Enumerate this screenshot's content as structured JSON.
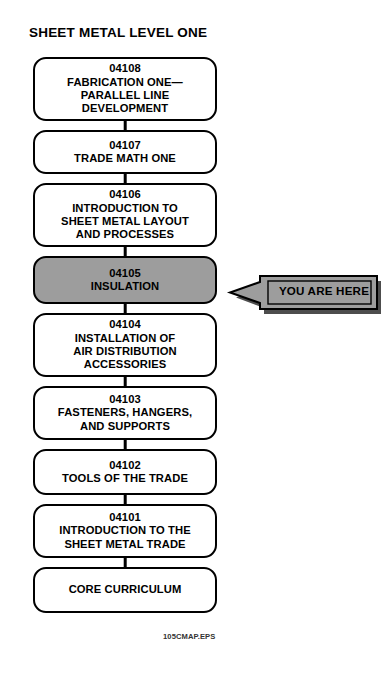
{
  "title": "SHEET METAL LEVEL ONE",
  "footer_code": "105CMAP.EPS",
  "colors": {
    "highlight_fill": "#9d9d9d",
    "callout_fill": "#9d9d9d",
    "callout_shadow": "#4d4d4d",
    "outline": "#000000",
    "node_fill": "#ffffff",
    "page_background": "#ffffff"
  },
  "callout": {
    "label": "YOU ARE HERE",
    "points_to": "04105"
  },
  "flow": {
    "orientation": "vertical-descending",
    "nodes": [
      {
        "code": "04108",
        "lines": [
          "FABRICATION ONE—",
          "PARALLEL LINE",
          "DEVELOPMENT"
        ],
        "highlighted": false,
        "height": 64
      },
      {
        "code": "04107",
        "lines": [
          "TRADE MATH ONE"
        ],
        "highlighted": false,
        "height": 44
      },
      {
        "code": "04106",
        "lines": [
          "INTRODUCTION TO",
          "SHEET METAL LAYOUT",
          "AND PROCESSES"
        ],
        "highlighted": false,
        "height": 64
      },
      {
        "code": "04105",
        "lines": [
          "INSULATION"
        ],
        "highlighted": true,
        "height": 48
      },
      {
        "code": "04104",
        "lines": [
          "INSTALLATION OF",
          "AIR DISTRIBUTION",
          "ACCESSORIES"
        ],
        "highlighted": false,
        "height": 64
      },
      {
        "code": "04103",
        "lines": [
          "FASTENERS, HANGERS,",
          "AND SUPPORTS"
        ],
        "highlighted": false,
        "height": 54
      },
      {
        "code": "04102",
        "lines": [
          "TOOLS OF THE TRADE"
        ],
        "highlighted": false,
        "height": 46
      },
      {
        "code": "04101",
        "lines": [
          "INTRODUCTION TO THE",
          "SHEET METAL TRADE"
        ],
        "highlighted": false,
        "height": 54
      },
      {
        "code": "",
        "lines": [
          "CORE CURRICULUM"
        ],
        "highlighted": false,
        "height": 46
      }
    ]
  }
}
